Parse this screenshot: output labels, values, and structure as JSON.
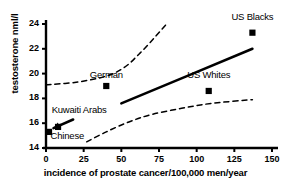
{
  "chart_data": {
    "type": "scatter",
    "title": "",
    "xlabel": "incidence of prostate cancer/100,000 men/year",
    "ylabel": "testosterone nml/l",
    "xlim": [
      0,
      150
    ],
    "ylim": [
      14,
      24
    ],
    "xticks": [
      0,
      25,
      50,
      75,
      100,
      125,
      150
    ],
    "yticks": [
      14,
      16,
      18,
      20,
      22,
      24
    ],
    "grid": false,
    "legend": "none",
    "marker": "filled-square",
    "marker_color": "#000000",
    "points": [
      {
        "label": "Chinese",
        "x": 2,
        "y": 15.3
      },
      {
        "label": "Kuwaiti Arabs",
        "x": 8,
        "y": 15.7
      },
      {
        "label": "German",
        "x": 40,
        "y": 19.0
      },
      {
        "label": "US Whites",
        "x": 108,
        "y": 18.6
      },
      {
        "label": "US Blacks",
        "x": 137,
        "y": 23.3
      }
    ],
    "annotations": [
      {
        "text": "US Blacks",
        "x": 137,
        "y": 24.6
      },
      {
        "text": "US Whites",
        "x": 108,
        "y": 19.9
      },
      {
        "text": "German",
        "x": 40,
        "y": 19.9
      },
      {
        "text": "Kuwaiti Arabs",
        "x": 22,
        "y": 17.1
      },
      {
        "text": "Chinese",
        "x": 14,
        "y": 15.0
      }
    ],
    "series": [
      {
        "name": "regression-line",
        "style": "solid",
        "points": [
          [
            50,
            17.6
          ],
          [
            137,
            22.0
          ]
        ]
      },
      {
        "name": "upper-confidence-band",
        "style": "dashed",
        "points": [
          [
            0,
            19.1
          ],
          [
            20,
            19.3
          ],
          [
            40,
            19.8
          ],
          [
            52,
            20.5
          ],
          [
            62,
            21.6
          ],
          [
            72,
            22.9
          ],
          [
            80,
            24.0
          ]
        ]
      },
      {
        "name": "lower-confidence-band",
        "style": "dashed",
        "points": [
          [
            27,
            14.5
          ],
          [
            40,
            15.3
          ],
          [
            55,
            16.1
          ],
          [
            70,
            16.7
          ],
          [
            90,
            17.2
          ],
          [
            110,
            17.6
          ],
          [
            137,
            17.9
          ]
        ]
      }
    ],
    "pointer_arrow": {
      "name": "cluster-pointer",
      "from": [
        18,
        16.3
      ],
      "to": [
        5,
        15.6
      ]
    }
  }
}
